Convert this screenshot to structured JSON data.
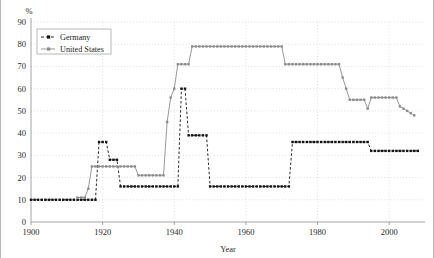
{
  "chart_data": {
    "type": "line",
    "title": "",
    "subtitle": "",
    "xlabel": "Year",
    "ylabel": "",
    "unit_label": "%",
    "xlim": [
      1900,
      2010
    ],
    "ylim": [
      0,
      90
    ],
    "xticks": [
      1900,
      1920,
      1940,
      1960,
      1980,
      2000
    ],
    "yticks": [
      0,
      10,
      20,
      30,
      40,
      50,
      60,
      70,
      80,
      90
    ],
    "grid": true,
    "legend_position": "top-left",
    "series": [
      {
        "name": "Germany",
        "color": "#141414",
        "style": "dashed",
        "marker": "square",
        "x": [
          1900,
          1901,
          1902,
          1903,
          1904,
          1905,
          1906,
          1907,
          1908,
          1909,
          1910,
          1911,
          1912,
          1913,
          1914,
          1915,
          1916,
          1917,
          1918,
          1919,
          1920,
          1921,
          1922,
          1923,
          1924,
          1925,
          1926,
          1927,
          1928,
          1929,
          1930,
          1931,
          1932,
          1933,
          1934,
          1935,
          1936,
          1937,
          1938,
          1939,
          1940,
          1941,
          1942,
          1943,
          1944,
          1945,
          1946,
          1947,
          1948,
          1949,
          1950,
          1951,
          1952,
          1953,
          1954,
          1955,
          1956,
          1957,
          1958,
          1959,
          1960,
          1961,
          1962,
          1963,
          1964,
          1965,
          1966,
          1967,
          1968,
          1969,
          1970,
          1971,
          1972,
          1973,
          1974,
          1975,
          1976,
          1977,
          1978,
          1979,
          1980,
          1981,
          1982,
          1983,
          1984,
          1985,
          1986,
          1987,
          1988,
          1989,
          1990,
          1991,
          1992,
          1993,
          1994,
          1995,
          1996,
          1997,
          1998,
          1999,
          2000,
          2001,
          2002,
          2003,
          2004,
          2005,
          2006,
          2007,
          2008
        ],
        "y": [
          10,
          10,
          10,
          10,
          10,
          10,
          10,
          10,
          10,
          10,
          10,
          10,
          10,
          10,
          10,
          10,
          10,
          10,
          10,
          36,
          36,
          36,
          28,
          28,
          28,
          16,
          16,
          16,
          16,
          16,
          16,
          16,
          16,
          16,
          16,
          16,
          16,
          16,
          16,
          16,
          16,
          16,
          60,
          60,
          39,
          39,
          39,
          39,
          39,
          39,
          16,
          16,
          16,
          16,
          16,
          16,
          16,
          16,
          16,
          16,
          16,
          16,
          16,
          16,
          16,
          16,
          16,
          16,
          16,
          16,
          16,
          16,
          16,
          36,
          36,
          36,
          36,
          36,
          36,
          36,
          36,
          36,
          36,
          36,
          36,
          36,
          36,
          36,
          36,
          36,
          36,
          36,
          36,
          36,
          36,
          32,
          32,
          32,
          32,
          32,
          32,
          32,
          32,
          32,
          32,
          32,
          32,
          32,
          32
        ]
      },
      {
        "name": "United States",
        "color": "#8c8c8c",
        "style": "solid",
        "marker": "square",
        "x": [
          1913,
          1914,
          1915,
          1916,
          1917,
          1918,
          1919,
          1920,
          1921,
          1922,
          1923,
          1924,
          1925,
          1926,
          1927,
          1928,
          1929,
          1930,
          1931,
          1932,
          1933,
          1934,
          1935,
          1936,
          1937,
          1938,
          1939,
          1940,
          1941,
          1942,
          1943,
          1944,
          1945,
          1946,
          1947,
          1948,
          1949,
          1950,
          1951,
          1952,
          1953,
          1954,
          1955,
          1956,
          1957,
          1958,
          1959,
          1960,
          1961,
          1962,
          1963,
          1964,
          1965,
          1966,
          1967,
          1968,
          1969,
          1970,
          1971,
          1972,
          1973,
          1974,
          1975,
          1976,
          1977,
          1978,
          1979,
          1980,
          1981,
          1982,
          1983,
          1984,
          1985,
          1986,
          1987,
          1988,
          1989,
          1990,
          1991,
          1992,
          1993,
          1994,
          1995,
          1996,
          1997,
          1998,
          1999,
          2000,
          2001,
          2002,
          2003,
          2004,
          2005,
          2006,
          2007
        ],
        "y": [
          11,
          11,
          11,
          15,
          25,
          25,
          25,
          25,
          25,
          25,
          25,
          25,
          25,
          25,
          25,
          25,
          25,
          21,
          21,
          21,
          21,
          21,
          21,
          21,
          21,
          45,
          56,
          60,
          71,
          71,
          71,
          71,
          79,
          79,
          79,
          79,
          79,
          79,
          79,
          79,
          79,
          79,
          79,
          79,
          79,
          79,
          79,
          79,
          79,
          79,
          79,
          79,
          79,
          79,
          79,
          79,
          79,
          79,
          71,
          71,
          71,
          71,
          71,
          71,
          71,
          71,
          71,
          71,
          71,
          71,
          71,
          71,
          71,
          71,
          65,
          60,
          55,
          55,
          55,
          55,
          55,
          51,
          56,
          56,
          56,
          56,
          56,
          56,
          56,
          56,
          52,
          51,
          50,
          49,
          48
        ]
      }
    ]
  }
}
